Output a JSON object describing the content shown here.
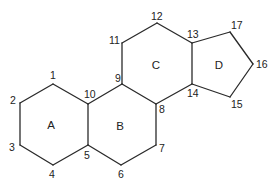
{
  "colors": {
    "stroke": "#2a2a2a",
    "text": "#222222",
    "background": "#ffffff"
  },
  "atoms": [
    {
      "id": "1",
      "label": "1",
      "x": 53,
      "y": 84,
      "lx": 50,
      "ly": 79
    },
    {
      "id": "2",
      "label": "2",
      "x": 20,
      "y": 103,
      "lx": 10,
      "ly": 104
    },
    {
      "id": "3",
      "label": "3",
      "x": 20,
      "y": 145,
      "lx": 9,
      "ly": 151
    },
    {
      "id": "4",
      "label": "4",
      "x": 53,
      "y": 165,
      "lx": 49,
      "ly": 178
    },
    {
      "id": "5",
      "label": "5",
      "x": 88,
      "y": 145,
      "lx": 84,
      "ly": 159
    },
    {
      "id": "6",
      "label": "6",
      "x": 121,
      "y": 165,
      "lx": 118,
      "ly": 178
    },
    {
      "id": "7",
      "label": "7",
      "x": 156,
      "y": 145,
      "lx": 159,
      "ly": 152
    },
    {
      "id": "8",
      "label": "8",
      "x": 156,
      "y": 104,
      "lx": 159,
      "ly": 113
    },
    {
      "id": "9",
      "label": "9",
      "x": 122,
      "y": 84,
      "lx": 115,
      "ly": 82
    },
    {
      "id": "10",
      "label": "10",
      "x": 88,
      "y": 104,
      "lx": 84,
      "ly": 98
    },
    {
      "id": "11",
      "label": "11",
      "x": 122,
      "y": 43,
      "lx": 109,
      "ly": 44
    },
    {
      "id": "12",
      "label": "12",
      "x": 157,
      "y": 23,
      "lx": 151,
      "ly": 20
    },
    {
      "id": "13",
      "label": "13",
      "x": 192,
      "y": 43,
      "lx": 187,
      "ly": 38
    },
    {
      "id": "14",
      "label": "14",
      "x": 192,
      "y": 84,
      "lx": 187,
      "ly": 97
    },
    {
      "id": "15",
      "label": "15",
      "x": 230,
      "y": 97,
      "lx": 231,
      "ly": 108
    },
    {
      "id": "16",
      "label": "16",
      "x": 253,
      "y": 64,
      "lx": 256,
      "ly": 68
    },
    {
      "id": "17",
      "label": "17",
      "x": 230,
      "y": 32,
      "lx": 231,
      "ly": 29
    }
  ],
  "bonds": [
    [
      "1",
      "2"
    ],
    [
      "2",
      "3"
    ],
    [
      "3",
      "4"
    ],
    [
      "4",
      "5"
    ],
    [
      "5",
      "10"
    ],
    [
      "10",
      "1"
    ],
    [
      "5",
      "6"
    ],
    [
      "6",
      "7"
    ],
    [
      "7",
      "8"
    ],
    [
      "8",
      "9"
    ],
    [
      "9",
      "10"
    ],
    [
      "9",
      "11"
    ],
    [
      "11",
      "12"
    ],
    [
      "12",
      "13"
    ],
    [
      "13",
      "14"
    ],
    [
      "14",
      "8"
    ],
    [
      "13",
      "17"
    ],
    [
      "17",
      "16"
    ],
    [
      "16",
      "15"
    ],
    [
      "15",
      "14"
    ]
  ],
  "rings": [
    {
      "label": "A",
      "x": 51,
      "y": 129
    },
    {
      "label": "B",
      "x": 120,
      "y": 130
    },
    {
      "label": "C",
      "x": 156,
      "y": 69
    },
    {
      "label": "D",
      "x": 219,
      "y": 69
    }
  ]
}
